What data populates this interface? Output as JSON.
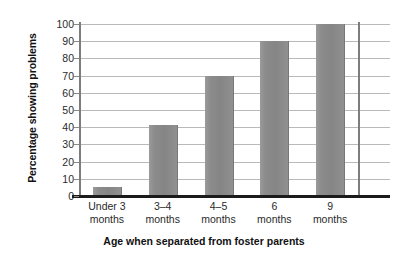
{
  "chart_data": {
    "type": "bar",
    "title": "",
    "xlabel": "Age when separated from foster parents",
    "ylabel": "Percentage showing problems",
    "categories": [
      "Under 3 months",
      "3–4 months",
      "4–5 months",
      "6 months",
      "9 months"
    ],
    "category_lines": [
      [
        "Under 3",
        "months"
      ],
      [
        "3–4",
        "months"
      ],
      [
        "4–5",
        "months"
      ],
      [
        "6",
        "months"
      ],
      [
        "9",
        "months"
      ]
    ],
    "values": [
      5,
      41,
      70,
      90,
      100
    ],
    "ylim": [
      0,
      100
    ],
    "yticks": [
      0,
      10,
      20,
      30,
      40,
      50,
      60,
      70,
      80,
      90,
      100
    ],
    "ytick_labels": [
      "0",
      "10",
      "20",
      "30",
      "40",
      "50",
      "60",
      "70",
      "80",
      "90",
      "100"
    ],
    "grid": true,
    "legend": "none",
    "bar_color": "#8a8a8a",
    "grid_color": "#b9b9b9",
    "axis_color": "#1b1b1b"
  }
}
